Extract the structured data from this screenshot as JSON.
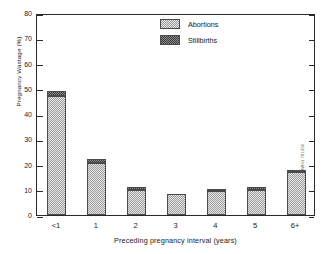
{
  "chart_data": {
    "type": "bar",
    "title": "",
    "subtitle": "",
    "xlabel": "Preceding pregnancy interval (years)",
    "ylabel": "Pregnancy Wastage (%)",
    "categories": [
      "<1",
      "1",
      "2",
      "3",
      "4",
      "5",
      "6+"
    ],
    "ylim": [
      0,
      80
    ],
    "yticks": [
      0,
      10,
      20,
      30,
      40,
      50,
      60,
      70,
      80
    ],
    "ytick_labels": [
      "0",
      "10",
      "20",
      "30",
      "40",
      "50",
      "60",
      "70",
      "80"
    ],
    "grid": false,
    "stacked": true,
    "legend_position": "top-right",
    "series": [
      {
        "name": "Abortions",
        "color": "#e9e9e9",
        "pattern": "light-stipple",
        "values": [
          47.0,
          20.5,
          10.0,
          8.2,
          9.5,
          10.0,
          17.0
        ]
      },
      {
        "name": "Stillbirths",
        "color": "#3a3a3a",
        "pattern": "dark-checker",
        "values": [
          2.0,
          1.7,
          1.2,
          0.0,
          1.0,
          1.2,
          0.8
        ]
      }
    ],
    "totals": [
      49.0,
      22.2,
      11.2,
      8.2,
      10.5,
      11.2,
      17.8
    ],
    "annotations": [
      {
        "text": "WHO 781206",
        "position": "right-edge-vertical"
      }
    ]
  },
  "legend": {
    "items": [
      {
        "label": "Abortions"
      },
      {
        "label": "Stillbirths"
      }
    ]
  },
  "credit": {
    "text": "WHO 781206"
  }
}
